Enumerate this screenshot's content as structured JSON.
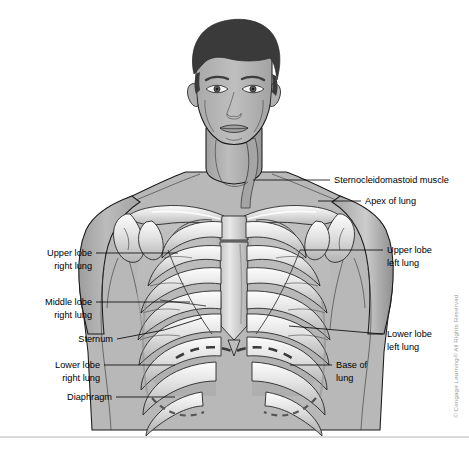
{
  "figure": {
    "background_color": "#ffffff",
    "line_color": "#000000",
    "border_color": "#b6b6b6"
  },
  "copyright": {
    "text": "© Cengage Learning® All Rights Reserved",
    "color": "#9a9a9a",
    "orientation": "vertical"
  },
  "labels": [
    {
      "id": "sternocleidomastoid-muscle",
      "text": "Sternocleidomastoid muscle",
      "side": "right",
      "text_x": 334,
      "text_y": 183,
      "leader": "M 330 180 L 253 180"
    },
    {
      "id": "apex-of-lung",
      "text": "Apex of lung",
      "side": "right",
      "text_x": 365,
      "text_y": 204,
      "leader": "M 361 201 L 318 201"
    },
    {
      "id": "upper-lobe-left-lung",
      "text": "Upper lobe",
      "text2": "left lung",
      "side": "right",
      "text_x": 387,
      "text_y": 253,
      "text2_y": 266,
      "leader": "M 383 250 L 300 250"
    },
    {
      "id": "lower-lobe-left-lung",
      "text": "Lower lobe",
      "text2": "left lung",
      "side": "right",
      "text_x": 387,
      "text_y": 337,
      "text2_y": 350,
      "leader": "M 383 334 L 289 326"
    },
    {
      "id": "base-of-lung",
      "text": "Base of",
      "text2": "lung",
      "side": "right",
      "text_x": 336,
      "text_y": 368,
      "text2_y": 381,
      "leader": "M 332 365 L 290 365"
    },
    {
      "id": "upper-lobe-right-lung",
      "text": "Upper lobe",
      "text2": "right lung",
      "side": "left",
      "text_x": 92,
      "text_y": 256,
      "text2_y": 269,
      "leader": "M 96 253 L 178 253"
    },
    {
      "id": "middle-lobe-right-lung",
      "text": "Middle lobe",
      "text2": "right lung",
      "side": "left",
      "text_x": 92,
      "text_y": 305,
      "text2_y": 318,
      "leader": "M 96 302 L 190 302"
    },
    {
      "id": "sternum",
      "text": "Sternum",
      "side": "left",
      "text_x": 113,
      "text_y": 342,
      "leader": "M 117 339 L 164 330 L 202 318"
    },
    {
      "id": "lower-lobe-right-lung",
      "text": "Lower lobe",
      "text2": "right lung",
      "side": "left",
      "text_x": 100,
      "text_y": 368,
      "text2_y": 381,
      "leader": "M 104 365 L 175 365"
    },
    {
      "id": "diaphragm",
      "text": "Diaphragm",
      "side": "left",
      "text_x": 112,
      "text_y": 400,
      "leader": "M 116 397 L 175 397"
    }
  ],
  "palette": {
    "hair": "#3a3a3a",
    "skin": "#b4b4b4",
    "skin_shadow": "#9a9a9a",
    "skin_light": "#c9c9c9",
    "bone_light": "#f2f2f2",
    "bone_mid": "#d5d5d5",
    "bone_shadow": "#a8a8a8",
    "lung_field": "#c2c2c2",
    "outline": "#1a1a1a"
  }
}
